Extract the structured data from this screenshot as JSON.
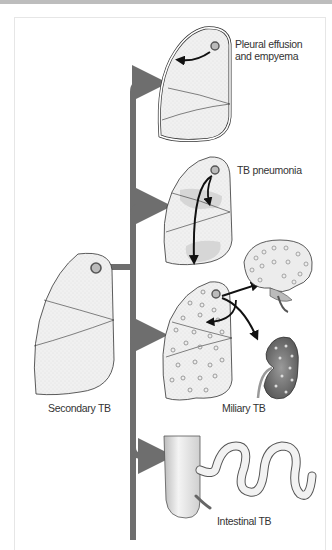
{
  "diagram": {
    "source": {
      "label": "Secondary TB"
    },
    "outcomes": [
      {
        "id": "pleural",
        "label_line1": "Pleural effusion",
        "label_line2": "and empyema"
      },
      {
        "id": "pneumonia",
        "label": "TB pneumonia"
      },
      {
        "id": "miliary",
        "label": "Miliary TB"
      },
      {
        "id": "intestinal",
        "label": "Intestinal TB"
      }
    ],
    "colors": {
      "connector": "#6e6e6e",
      "lung_fill": "#eeeeee",
      "lesion_fill": "#bdbdbd",
      "outline": "#333333",
      "kidney": "#7a7a7a"
    }
  }
}
